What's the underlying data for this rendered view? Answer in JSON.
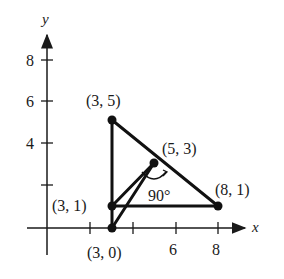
{
  "diagram": {
    "type": "coordinate-geometry",
    "axes": {
      "x_label": "x",
      "y_label": "y",
      "x_ticks": [
        {
          "value": 2,
          "label": ""
        },
        {
          "value": 4,
          "label": ""
        },
        {
          "value": 6,
          "label": "6"
        },
        {
          "value": 8,
          "label": "8"
        }
      ],
      "y_ticks": [
        {
          "value": 2,
          "label": ""
        },
        {
          "value": 4,
          "label": "4"
        },
        {
          "value": 6,
          "label": "6"
        },
        {
          "value": 8,
          "label": "8"
        }
      ]
    },
    "points": [
      {
        "x": 3,
        "y": 5,
        "label": "(3, 5)"
      },
      {
        "x": 3,
        "y": 1,
        "label": "(3, 1)"
      },
      {
        "x": 3,
        "y": 0,
        "label": "(3, 0)"
      },
      {
        "x": 5,
        "y": 3,
        "label": "(5, 3)"
      },
      {
        "x": 8,
        "y": 1,
        "label": "(8, 1)"
      }
    ],
    "segments": [
      [
        "(3, 5)",
        "(3, 0)"
      ],
      [
        "(3, 5)",
        "(8, 1)"
      ],
      [
        "(3, 1)",
        "(8, 1)"
      ],
      [
        "(3, 1)",
        "(5, 3)"
      ],
      [
        "(3, 0)",
        "(5, 3)"
      ]
    ],
    "angle_annotation": {
      "label": "90°",
      "at": "(5, 3)"
    }
  }
}
